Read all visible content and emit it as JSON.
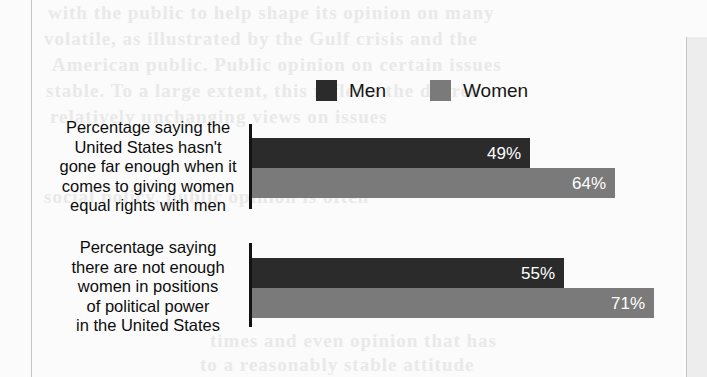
{
  "chart_data": {
    "type": "bar",
    "orientation": "horizontal",
    "title": "",
    "subtitle": "",
    "xlabel": "",
    "ylabel": "",
    "xlim": [
      0,
      75
    ],
    "grid": false,
    "legend_position": "top-center",
    "categories": [
      "Percentage saying the\nUnited States hasn't\ngone far enough when it\ncomes to giving women\nequal rights with men",
      "Percentage saying\nthere are not enough\nwomen in positions\nof political power\nin the United States"
    ],
    "series": [
      {
        "name": "Men",
        "color": "#2b2b2b",
        "values": [
          49,
          64
        ],
        "labels": [
          "49%",
          "55%"
        ]
      },
      {
        "name": "Women",
        "color": "#7a7a7a",
        "values": [
          64,
          71
        ],
        "labels": [
          "64%",
          "71%"
        ]
      }
    ],
    "data_points": [
      {
        "category_index": 0,
        "series": "Men",
        "value": 49,
        "label": "49%"
      },
      {
        "category_index": 0,
        "series": "Women",
        "value": 64,
        "label": "64%"
      },
      {
        "category_index": 1,
        "series": "Men",
        "value": 55,
        "label": "55%"
      },
      {
        "category_index": 1,
        "series": "Women",
        "value": 71,
        "label": "71%"
      }
    ]
  },
  "legend": {
    "items": [
      {
        "label": "Men",
        "color": "#2b2b2b"
      },
      {
        "label": "Women",
        "color": "#7a7a7a"
      }
    ]
  },
  "groups": [
    {
      "label": "Percentage saying the\nUnited States hasn't\ngone far enough when it\ncomes to giving women\nequal rights with men",
      "bars": [
        {
          "series": "Men",
          "value": 49,
          "label": "49%",
          "color": "#2b2b2b"
        },
        {
          "series": "Women",
          "value": 64,
          "label": "64%",
          "color": "#7a7a7a"
        }
      ]
    },
    {
      "label": "Percentage saying\nthere are not enough\nwomen in positions\nof political power\nin the United States",
      "bars": [
        {
          "series": "Men",
          "value": 55,
          "label": "55%",
          "color": "#2b2b2b"
        },
        {
          "series": "Women",
          "value": 71,
          "label": "71%",
          "color": "#7a7a7a"
        }
      ]
    }
  ],
  "page_artifacts": {
    "ghost_lines": [
      "with the public to help shape its opinion on many",
      "volatile, as illustrated by the Gulf crisis and the",
      "American public. Public opinion on certain issues",
      "stable. To a large extent, this reflects the degree",
      "relatively unchanging views on issues",
      "social policy, public opinion is often",
      "times and even opinion that has",
      "to a reasonably stable attitude"
    ]
  }
}
